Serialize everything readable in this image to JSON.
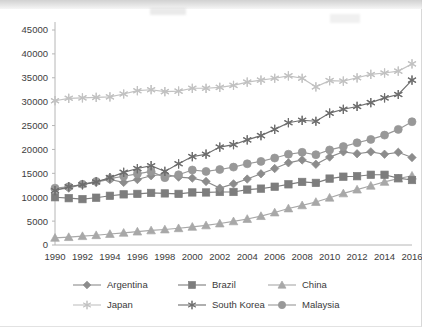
{
  "chart_data": {
    "type": "line",
    "title": "",
    "subtitle": "",
    "xlabel": "",
    "ylabel": "",
    "xlim": [
      1990,
      2016
    ],
    "ylim": [
      0,
      45000
    ],
    "ytick_step": 5000,
    "xtick_step": 2,
    "grid": false,
    "legend_position": "bottom",
    "legend_columns": 3,
    "yticks": [
      "0",
      "5000",
      "10000",
      "15000",
      "20000",
      "25000",
      "30000",
      "35000",
      "40000",
      "45000"
    ],
    "xticks": [
      "1990",
      "1992",
      "1994",
      "1996",
      "1998",
      "2000",
      "2002",
      "2004",
      "2006",
      "2008",
      "2010",
      "2012",
      "2014",
      "2016"
    ],
    "x": [
      1990,
      1991,
      1992,
      1993,
      1994,
      1995,
      1996,
      1997,
      1998,
      1999,
      2000,
      2001,
      2002,
      2003,
      2004,
      2005,
      2006,
      2007,
      2008,
      2009,
      2010,
      2011,
      2012,
      2013,
      2014,
      2015,
      2016
    ],
    "series": [
      {
        "name": "Argentina",
        "marker": "diamond",
        "color": "#8c8c8c",
        "values": [
          11600,
          11900,
          12700,
          13200,
          13700,
          13100,
          13700,
          14500,
          14800,
          14200,
          14000,
          13300,
          11900,
          12800,
          13800,
          14900,
          16000,
          17200,
          17800,
          16900,
          18400,
          19500,
          19100,
          19500,
          19000,
          19400,
          18300
        ]
      },
      {
        "name": "Brazil",
        "marker": "square",
        "color": "#7d7d7d",
        "values": [
          10000,
          9800,
          9600,
          9900,
          10300,
          10600,
          10700,
          10900,
          10800,
          10700,
          11000,
          11000,
          11100,
          11100,
          11600,
          11800,
          12200,
          12700,
          13200,
          13000,
          13900,
          14300,
          14400,
          14700,
          14700,
          14000,
          13600
        ]
      },
      {
        "name": "China",
        "marker": "triangle",
        "color": "#a8a8a8",
        "values": [
          1500,
          1650,
          1850,
          2050,
          2300,
          2550,
          2800,
          3050,
          3250,
          3500,
          3800,
          4100,
          4500,
          4950,
          5450,
          6050,
          6800,
          7650,
          8300,
          9000,
          9900,
          10800,
          11600,
          12400,
          13200,
          13900,
          14500
        ]
      },
      {
        "name": "Japan",
        "marker": "star-light",
        "color": "#c2c2c2",
        "values": [
          30200,
          30700,
          30800,
          30900,
          31000,
          31600,
          32300,
          32500,
          32100,
          32200,
          32800,
          32800,
          33000,
          33400,
          34100,
          34500,
          34900,
          35400,
          34900,
          33100,
          34400,
          34300,
          35000,
          35700,
          36000,
          36400,
          37900
        ]
      },
      {
        "name": "South Korea",
        "marker": "star",
        "color": "#6e6e6e",
        "values": [
          11400,
          12200,
          12600,
          13200,
          14100,
          15200,
          16000,
          16600,
          15400,
          17000,
          18500,
          19000,
          20500,
          21000,
          22000,
          22900,
          24200,
          25600,
          26100,
          25900,
          27600,
          28400,
          29000,
          29800,
          30800,
          31500,
          34500
        ]
      },
      {
        "name": "Malaysia",
        "marker": "circle",
        "color": "#989898",
        "values": [
          11900,
          12200,
          12700,
          13300,
          13900,
          14400,
          14900,
          15400,
          14100,
          14700,
          15700,
          15400,
          15800,
          16300,
          17000,
          17500,
          18200,
          19000,
          19400,
          18900,
          19900,
          20600,
          21400,
          22100,
          23000,
          24200,
          25800
        ]
      }
    ]
  },
  "legend": {
    "items": [
      {
        "label": "Argentina"
      },
      {
        "label": "Brazil"
      },
      {
        "label": "China"
      },
      {
        "label": "Japan"
      },
      {
        "label": "South Korea"
      },
      {
        "label": "Malaysia"
      }
    ]
  }
}
